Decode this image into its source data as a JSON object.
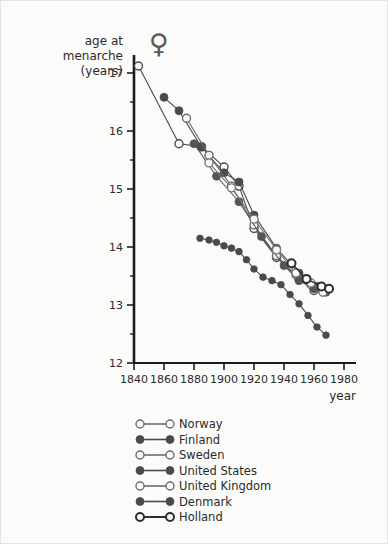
{
  "chart_data": {
    "type": "line",
    "title": "",
    "subtitle": "",
    "ylabel_lines": [
      "age at",
      "menarche",
      "(years)"
    ],
    "xlabel": "year",
    "xlim": [
      1840,
      1980
    ],
    "ylim": [
      12,
      17
    ],
    "x_ticks": [
      1840,
      1860,
      1880,
      1900,
      1920,
      1940,
      1960,
      1980
    ],
    "y_ticks": [
      12,
      13,
      14,
      15,
      16,
      17
    ],
    "y_minor_ticks": [
      12.5,
      13.5,
      14.5,
      15.5,
      16.5
    ],
    "grid": false,
    "legend_position": "below",
    "marker_symbol_note": "open = hollow circle, filled = solid circle",
    "series": [
      {
        "name": "Norway",
        "marker": "open",
        "color": "#4a4a4a",
        "points": [
          [
            1843,
            17.12
          ],
          [
            1870,
            15.78
          ],
          [
            1885,
            15.73
          ],
          [
            1900,
            15.38
          ],
          [
            1910,
            15.05
          ],
          [
            1920,
            14.32
          ],
          [
            1935,
            13.82
          ],
          [
            1950,
            13.45
          ],
          [
            1960,
            13.25
          ],
          [
            1968,
            13.25
          ]
        ]
      },
      {
        "name": "Finland",
        "marker": "filled",
        "color": "#4a4a4a",
        "points": [
          [
            1860,
            16.58
          ],
          [
            1870,
            16.35
          ],
          [
            1885,
            15.72
          ],
          [
            1900,
            15.28
          ],
          [
            1910,
            15.12
          ],
          [
            1920,
            14.55
          ],
          [
            1935,
            13.98
          ],
          [
            1950,
            13.55
          ],
          [
            1962,
            13.32
          ],
          [
            1970,
            13.28
          ]
        ]
      },
      {
        "name": "Sweden",
        "marker": "open",
        "color": "#6b6b6b",
        "points": [
          [
            1875,
            16.22
          ],
          [
            1890,
            15.58
          ],
          [
            1905,
            15.05
          ],
          [
            1920,
            14.38
          ],
          [
            1935,
            13.85
          ],
          [
            1948,
            13.52
          ],
          [
            1958,
            13.35
          ],
          [
            1965,
            13.28
          ]
        ]
      },
      {
        "name": "United States",
        "marker": "filled",
        "color": "#555555",
        "points": [
          [
            1880,
            15.78
          ],
          [
            1895,
            15.22
          ],
          [
            1910,
            14.78
          ],
          [
            1925,
            14.18
          ],
          [
            1940,
            13.68
          ],
          [
            1950,
            13.42
          ],
          [
            1960,
            13.28
          ],
          [
            1968,
            13.22
          ]
        ]
      },
      {
        "name": "United Kingdom",
        "marker": "open",
        "color": "#777777",
        "points": [
          [
            1890,
            15.45
          ],
          [
            1905,
            15.02
          ],
          [
            1920,
            14.48
          ],
          [
            1935,
            13.95
          ],
          [
            1948,
            13.55
          ],
          [
            1958,
            13.38
          ],
          [
            1966,
            13.22
          ]
        ]
      },
      {
        "name": "Denmark",
        "marker": "filled",
        "color": "#4a4a4a",
        "points": [
          [
            1884,
            14.15
          ],
          [
            1890,
            14.12
          ],
          [
            1895,
            14.08
          ],
          [
            1900,
            14.02
          ],
          [
            1905,
            13.98
          ],
          [
            1910,
            13.92
          ],
          [
            1915,
            13.78
          ],
          [
            1920,
            13.62
          ],
          [
            1926,
            13.48
          ],
          [
            1932,
            13.42
          ],
          [
            1938,
            13.35
          ],
          [
            1944,
            13.18
          ],
          [
            1950,
            13.02
          ],
          [
            1956,
            12.82
          ],
          [
            1962,
            12.62
          ],
          [
            1968,
            12.48
          ]
        ]
      },
      {
        "name": "Holland",
        "marker": "open-bold",
        "color": "#2e2e2e",
        "points": [
          [
            1945,
            13.72
          ],
          [
            1955,
            13.45
          ],
          [
            1965,
            13.32
          ],
          [
            1970,
            13.28
          ]
        ]
      }
    ]
  },
  "symbols": {
    "venus": "♀"
  },
  "legend": {
    "items": [
      {
        "label": "Norway",
        "marker": "open"
      },
      {
        "label": "Finland",
        "marker": "filled"
      },
      {
        "label": "Sweden",
        "marker": "open"
      },
      {
        "label": "United States",
        "marker": "filled"
      },
      {
        "label": "United Kingdom",
        "marker": "open"
      },
      {
        "label": "Denmark",
        "marker": "filled"
      },
      {
        "label": "Holland",
        "marker": "open-bold"
      }
    ]
  }
}
